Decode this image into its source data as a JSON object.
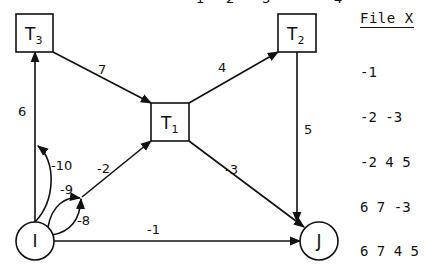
{
  "top_ticks": [
    "1",
    "2",
    "3",
    "4"
  ],
  "nodes": {
    "T3": {
      "label": "T",
      "sub": "3",
      "shape": "square"
    },
    "T1": {
      "label": "T",
      "sub": "1",
      "shape": "square"
    },
    "T2": {
      "label": "T",
      "sub": "2",
      "shape": "square"
    },
    "I": {
      "label": "I",
      "shape": "circle"
    },
    "J": {
      "label": "J",
      "shape": "circle"
    }
  },
  "edges": [
    {
      "from": "T3",
      "to": "T1",
      "label": "7"
    },
    {
      "from": "T1",
      "to": "T2",
      "label": "4"
    },
    {
      "from": "T2",
      "to": "J",
      "label": "5"
    },
    {
      "from": "T1",
      "to": "J",
      "label": "-3"
    },
    {
      "from": "I",
      "to": "T3",
      "label": "6"
    },
    {
      "from": "I",
      "to": "T3",
      "label": "-10"
    },
    {
      "from": "I",
      "to": "T1",
      "label": "-2"
    },
    {
      "from": "I",
      "to": "T1",
      "label": "-9"
    },
    {
      "from": "I",
      "to": "T1",
      "label": "-8"
    },
    {
      "from": "I",
      "to": "J",
      "label": "-1"
    }
  ],
  "file_panel": {
    "title": "File X",
    "rows": [
      "-1",
      "-2 -3",
      "-2 4 5",
      "6 7 -3",
      "6 7 4 5"
    ]
  }
}
